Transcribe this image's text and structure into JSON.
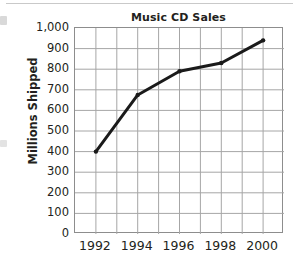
{
  "chart_data": {
    "type": "line",
    "title": "Music CD Sales",
    "xlabel": "",
    "ylabel": "Millions Shipped",
    "categories": [
      "1992",
      "1994",
      "1996",
      "1998",
      "2000"
    ],
    "x": [
      1992,
      1994,
      1996,
      1998,
      2000
    ],
    "values": [
      400,
      675,
      790,
      830,
      940
    ],
    "series": [
      {
        "name": "Music CD Sales",
        "values": [
          400,
          675,
          790,
          830,
          940
        ]
      }
    ],
    "xlim": [
      1991,
      2001
    ],
    "ylim": [
      0,
      1000
    ],
    "ytick_values": [
      0,
      100,
      200,
      300,
      400,
      500,
      600,
      700,
      800,
      900,
      1000
    ],
    "ytick_labels": [
      "0",
      "100",
      "200",
      "300",
      "400",
      "500",
      "600",
      "700",
      "800",
      "900",
      "1,000"
    ],
    "xtick_labels": [
      "1992",
      "1994",
      "1996",
      "1998",
      "2000"
    ],
    "grid": true,
    "grid_rows": 10,
    "grid_cols": 10,
    "legend": false,
    "legend_position": "none",
    "markers": true,
    "colors": {
      "line": "#1a1a1a",
      "marker": "#1a1a1a",
      "grid": "#a6a6a6",
      "axis": "#8d8d8d",
      "text": "#231f20",
      "background": "#ffffff"
    },
    "line_width": 3
  }
}
